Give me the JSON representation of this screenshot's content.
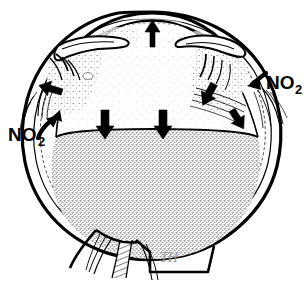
{
  "figure": {
    "domain": "anatomical-illustration",
    "title": "",
    "caption": "",
    "background_color": "#ffffff",
    "ink_color": "#000000",
    "signature": "TH",
    "signature_color": "#9a9a9a"
  },
  "labels": [
    {
      "id": "no2-left",
      "text": "NO",
      "subscript": "2",
      "full_text": "NO2",
      "position": "left",
      "x": 10,
      "y": 136,
      "color": "#000000",
      "leader": "arrow pointing up-right into sclera at left limbus"
    },
    {
      "id": "no2-right",
      "text": "NO",
      "subscript": "2",
      "full_text": "NO2",
      "position": "right",
      "x": 268,
      "y": 85,
      "color": "#000000",
      "leader": "arrow pointing left into sclera at right limbus"
    }
  ],
  "arrows": [
    {
      "id": "arrow-cornea-up",
      "direction": "up",
      "location": "cornea apex",
      "x": 152,
      "y": 30,
      "angle_deg": -90,
      "style": "solid-black-block"
    },
    {
      "id": "arrow-left-ciliary",
      "direction": "left",
      "location": "left ciliary body / iris root",
      "x": 68,
      "y": 95,
      "angle_deg": 200,
      "style": "solid-black-block"
    },
    {
      "id": "arrow-right-ciliary",
      "direction": "down-left",
      "location": "right ciliary body / iris root",
      "x": 218,
      "y": 78,
      "angle_deg": 120,
      "style": "solid-black-block"
    },
    {
      "id": "arrow-lens-down-left",
      "direction": "down",
      "location": "lens posterior surface, left of centre",
      "x": 105,
      "y": 125,
      "angle_deg": 90,
      "style": "solid-black-block"
    },
    {
      "id": "arrow-lens-down-right",
      "direction": "down",
      "location": "lens posterior surface, right of centre",
      "x": 163,
      "y": 125,
      "angle_deg": 90,
      "style": "solid-black-block"
    },
    {
      "id": "arrow-right-equator",
      "direction": "down-right",
      "location": "right lens equator / vitreous base",
      "x": 240,
      "y": 120,
      "angle_deg": 55,
      "style": "solid-black-block"
    }
  ],
  "structures": [
    {
      "id": "sclera",
      "name": "sclera",
      "fill": "#ffffff",
      "stroke": "#000000"
    },
    {
      "id": "cornea",
      "name": "cornea",
      "fill": "#ffffff",
      "stroke": "#000000"
    },
    {
      "id": "anterior-chamber",
      "name": "anterior chamber",
      "fill": "#ffffff",
      "stroke": "#000000"
    },
    {
      "id": "lens",
      "name": "lens",
      "fill": "#ffffff",
      "stroke": "#000000"
    },
    {
      "id": "vitreous-body",
      "name": "vitreous body",
      "fill": "#d8d8d8",
      "stroke": "#000000",
      "texture": "stipple"
    },
    {
      "id": "ciliary-body-left",
      "name": "ciliary body (left)",
      "fill": "#ffffff",
      "stroke": "#000000",
      "texture": "stipple"
    },
    {
      "id": "ciliary-body-right",
      "name": "ciliary body (right)",
      "fill": "#ffffff",
      "stroke": "#000000",
      "texture": "stipple"
    },
    {
      "id": "optic-nerve",
      "name": "optic nerve",
      "fill": "#ffffff",
      "stroke": "#000000",
      "texture": "hatch"
    },
    {
      "id": "muscle-fibers-right",
      "name": "extraocular fibers (right)",
      "fill": "none",
      "stroke": "#000000"
    },
    {
      "id": "muscle-fibers-left",
      "name": "extraocular fibers (left)",
      "fill": "none",
      "stroke": "#000000"
    }
  ]
}
